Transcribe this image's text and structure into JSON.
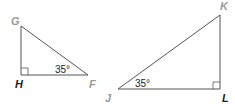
{
  "diagram": {
    "triangle_1": {
      "vertices": {
        "G": "G",
        "H": "H",
        "F": "F"
      },
      "right_angle_at": "H",
      "angle_label": "35°",
      "angle_at": "F"
    },
    "triangle_2": {
      "vertices": {
        "J": "J",
        "K": "K",
        "L": "L"
      },
      "right_angle_at": "L",
      "angle_label": "35°",
      "angle_at": "J"
    },
    "colors": {
      "line": "#555555",
      "label_light": "#9a9a9a",
      "label_dark": "#222222"
    }
  }
}
